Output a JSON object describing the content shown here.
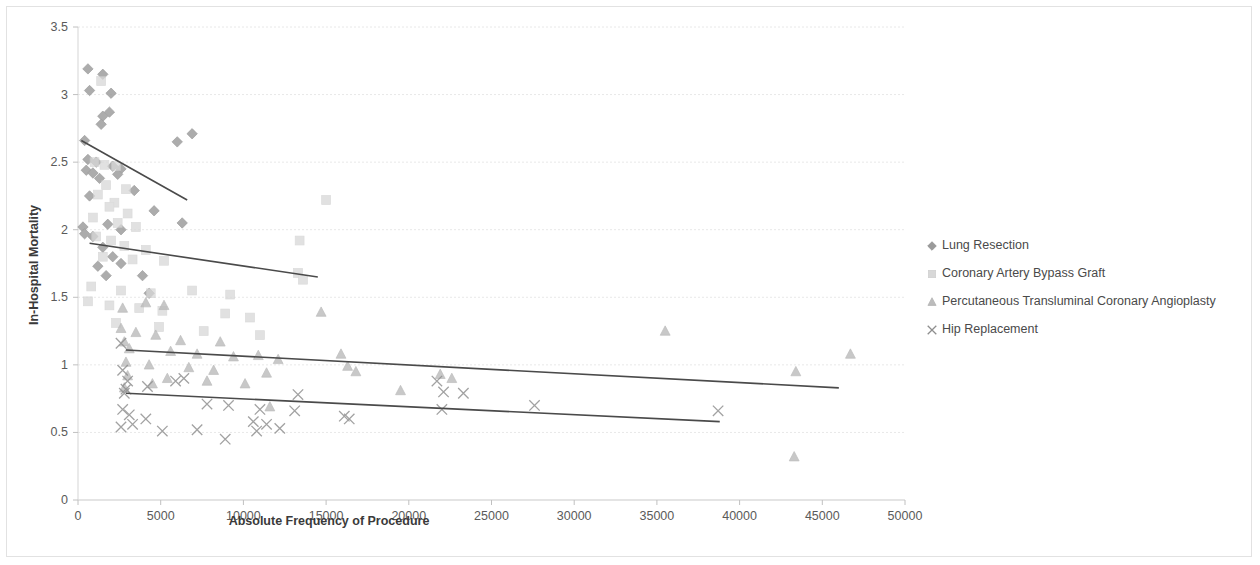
{
  "chart_data": {
    "type": "scatter",
    "title": "",
    "xlabel": "Absolute Frequency of Procedure",
    "ylabel": "In-Hospital Mortality",
    "xlim": [
      0,
      50000
    ],
    "ylim": [
      0,
      3.5
    ],
    "xticks": [
      0,
      5000,
      10000,
      15000,
      20000,
      25000,
      30000,
      35000,
      40000,
      45000,
      50000
    ],
    "xtick_labels": [
      "0",
      "5000",
      "10000",
      "15000",
      "20000",
      "25000",
      "30000",
      "35000",
      "40000",
      "45000",
      "50000"
    ],
    "yticks": [
      0,
      0.5,
      1,
      1.5,
      2,
      2.5,
      3,
      3.5
    ],
    "ytick_labels": [
      "0",
      "0.5",
      "1",
      "1.5",
      "2",
      "2.5",
      "3",
      "3.5"
    ],
    "grid": true,
    "grid_axis": "y",
    "legend_position": "right",
    "series": [
      {
        "name": "Lung Resection",
        "marker": "diamond",
        "color": "#9a9a9a",
        "points": [
          [
            600,
            3.19
          ],
          [
            1500,
            3.15
          ],
          [
            700,
            3.03
          ],
          [
            2000,
            3.01
          ],
          [
            1900,
            2.87
          ],
          [
            1500,
            2.84
          ],
          [
            1400,
            2.78
          ],
          [
            6000,
            2.65
          ],
          [
            6900,
            2.71
          ],
          [
            400,
            2.66
          ],
          [
            600,
            2.52
          ],
          [
            1100,
            2.5
          ],
          [
            2100,
            2.47
          ],
          [
            2600,
            2.45
          ],
          [
            500,
            2.44
          ],
          [
            900,
            2.42
          ],
          [
            2400,
            2.41
          ],
          [
            1300,
            2.38
          ],
          [
            700,
            2.25
          ],
          [
            3400,
            2.29
          ],
          [
            4600,
            2.14
          ],
          [
            300,
            2.02
          ],
          [
            1800,
            2.04
          ],
          [
            2600,
            2.0
          ],
          [
            6300,
            2.05
          ],
          [
            400,
            1.97
          ],
          [
            900,
            1.95
          ],
          [
            1500,
            1.87
          ],
          [
            2100,
            1.8
          ],
          [
            1200,
            1.73
          ],
          [
            1700,
            1.66
          ],
          [
            2600,
            1.75
          ],
          [
            3900,
            1.66
          ],
          [
            4300,
            1.53
          ]
        ]
      },
      {
        "name": "Coronary Artery Bypass Graft",
        "marker": "square",
        "color": "#d8d8d8",
        "points": [
          [
            1400,
            3.1
          ],
          [
            1000,
            2.5
          ],
          [
            1600,
            2.48
          ],
          [
            2300,
            2.47
          ],
          [
            1700,
            2.33
          ],
          [
            2900,
            2.3
          ],
          [
            1200,
            2.26
          ],
          [
            2200,
            2.2
          ],
          [
            1900,
            2.17
          ],
          [
            3000,
            2.12
          ],
          [
            900,
            2.09
          ],
          [
            2400,
            2.05
          ],
          [
            3500,
            2.02
          ],
          [
            15000,
            2.22
          ],
          [
            1100,
            1.95
          ],
          [
            2000,
            1.92
          ],
          [
            13400,
            1.92
          ],
          [
            2800,
            1.88
          ],
          [
            4100,
            1.85
          ],
          [
            1500,
            1.8
          ],
          [
            3300,
            1.78
          ],
          [
            5200,
            1.77
          ],
          [
            13300,
            1.68
          ],
          [
            13600,
            1.63
          ],
          [
            800,
            1.58
          ],
          [
            2600,
            1.55
          ],
          [
            4400,
            1.53
          ],
          [
            6900,
            1.55
          ],
          [
            9200,
            1.52
          ],
          [
            600,
            1.47
          ],
          [
            1900,
            1.44
          ],
          [
            3700,
            1.42
          ],
          [
            5100,
            1.4
          ],
          [
            8900,
            1.38
          ],
          [
            10400,
            1.35
          ],
          [
            2300,
            1.31
          ],
          [
            4900,
            1.28
          ],
          [
            7600,
            1.25
          ],
          [
            11000,
            1.22
          ]
        ]
      },
      {
        "name": "Percutaneous Transluminal Coronary Angioplasty",
        "marker": "triangle",
        "color": "#bcbcbc",
        "points": [
          [
            2700,
            1.42
          ],
          [
            4100,
            1.46
          ],
          [
            5200,
            1.44
          ],
          [
            14700,
            1.39
          ],
          [
            35500,
            1.25
          ],
          [
            2600,
            1.27
          ],
          [
            3500,
            1.24
          ],
          [
            4700,
            1.22
          ],
          [
            6200,
            1.18
          ],
          [
            2800,
            1.17
          ],
          [
            8600,
            1.17
          ],
          [
            15900,
            1.08
          ],
          [
            3100,
            1.12
          ],
          [
            5600,
            1.1
          ],
          [
            7200,
            1.08
          ],
          [
            9400,
            1.06
          ],
          [
            10900,
            1.07
          ],
          [
            12100,
            1.04
          ],
          [
            16300,
            0.99
          ],
          [
            2900,
            1.02
          ],
          [
            4300,
            1.0
          ],
          [
            6700,
            0.98
          ],
          [
            8200,
            0.96
          ],
          [
            11400,
            0.94
          ],
          [
            16800,
            0.95
          ],
          [
            21900,
            0.93
          ],
          [
            22600,
            0.9
          ],
          [
            46700,
            1.08
          ],
          [
            43400,
            0.95
          ],
          [
            3000,
            0.92
          ],
          [
            5400,
            0.9
          ],
          [
            7800,
            0.88
          ],
          [
            10100,
            0.86
          ],
          [
            19500,
            0.81
          ],
          [
            11600,
            0.69
          ],
          [
            43300,
            0.32
          ],
          [
            2800,
            0.83
          ],
          [
            4500,
            0.86
          ]
        ]
      },
      {
        "name": "Hip Replacement",
        "marker": "cross",
        "color": "#8e8e8e",
        "points": [
          [
            2600,
            1.16
          ],
          [
            2700,
            0.96
          ],
          [
            3000,
            0.88
          ],
          [
            2900,
            0.82
          ],
          [
            2800,
            0.79
          ],
          [
            4200,
            0.84
          ],
          [
            6400,
            0.9
          ],
          [
            5900,
            0.88
          ],
          [
            13300,
            0.78
          ],
          [
            16100,
            0.62
          ],
          [
            16400,
            0.6
          ],
          [
            21700,
            0.88
          ],
          [
            22100,
            0.8
          ],
          [
            23300,
            0.79
          ],
          [
            22000,
            0.67
          ],
          [
            27600,
            0.7
          ],
          [
            38700,
            0.66
          ],
          [
            2700,
            0.67
          ],
          [
            3100,
            0.63
          ],
          [
            4100,
            0.6
          ],
          [
            5100,
            0.51
          ],
          [
            7200,
            0.52
          ],
          [
            8900,
            0.45
          ],
          [
            10600,
            0.58
          ],
          [
            11400,
            0.56
          ],
          [
            11000,
            0.67
          ],
          [
            9100,
            0.7
          ],
          [
            7800,
            0.71
          ],
          [
            13100,
            0.66
          ],
          [
            2600,
            0.54
          ],
          [
            3300,
            0.56
          ],
          [
            12200,
            0.53
          ],
          [
            10800,
            0.51
          ]
        ]
      }
    ],
    "trendlines": [
      {
        "series": "Lung Resection",
        "x0": 200,
        "y0": 2.66,
        "x1": 6600,
        "y1": 2.22
      },
      {
        "series": "Coronary Artery Bypass Graft",
        "x0": 700,
        "y0": 1.9,
        "x1": 14500,
        "y1": 1.65
      },
      {
        "series": "Percutaneous Transluminal Coronary Angioplasty",
        "x0": 2900,
        "y0": 1.11,
        "x1": 46000,
        "y1": 0.83
      },
      {
        "series": "Hip Replacement",
        "x0": 2900,
        "y0": 0.79,
        "x1": 38800,
        "y1": 0.58
      }
    ]
  },
  "legend": {
    "items": [
      {
        "label": "Lung Resection",
        "marker": "diamond"
      },
      {
        "label": "Coronary Artery Bypass Graft",
        "marker": "square"
      },
      {
        "label": "Percutaneous Transluminal Coronary Angioplasty",
        "marker": "triangle"
      },
      {
        "label": "Hip Replacement",
        "marker": "cross"
      }
    ]
  }
}
